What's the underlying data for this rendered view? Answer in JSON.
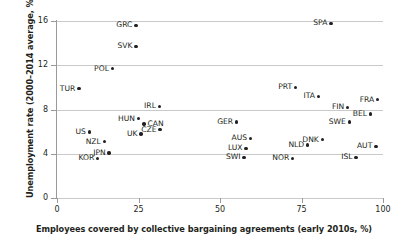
{
  "chart_data": {
    "type": "scatter",
    "title": "",
    "xlabel": "Employees covered by collective bargaining agreements (early 2010s, %)",
    "ylabel": "Unemployment rate (2000–2014 average, %)",
    "xlim": [
      0,
      100
    ],
    "ylim": [
      0,
      16
    ],
    "xticks": [
      "0",
      "25",
      "50",
      "75",
      "100"
    ],
    "yticks": [
      "0",
      "4",
      "8",
      "12",
      "16"
    ],
    "grid": "horizontal",
    "legend": "none",
    "points": [
      {
        "label": "GRC",
        "x": 24.2,
        "y": 15.6,
        "label_side": "left"
      },
      {
        "label": "SPA",
        "x": 84.0,
        "y": 15.8,
        "label_side": "left"
      },
      {
        "label": "SVK",
        "x": 24.2,
        "y": 13.7,
        "label_side": "left"
      },
      {
        "label": "POL",
        "x": 17.0,
        "y": 11.7,
        "label_side": "left"
      },
      {
        "label": "TUR",
        "x": 6.7,
        "y": 9.9,
        "label_side": "left"
      },
      {
        "label": "IRL",
        "x": 31.4,
        "y": 8.3,
        "label_side": "left"
      },
      {
        "label": "PRT",
        "x": 73.2,
        "y": 10.0,
        "label_side": "left"
      },
      {
        "label": "ITA",
        "x": 80.2,
        "y": 9.2,
        "label_side": "left"
      },
      {
        "label": "FRA",
        "x": 98.4,
        "y": 8.9,
        "label_side": "left"
      },
      {
        "label": "FIN",
        "x": 89.2,
        "y": 8.2,
        "label_side": "left"
      },
      {
        "label": "BEL",
        "x": 96.2,
        "y": 7.6,
        "label_side": "left"
      },
      {
        "label": "SWE",
        "x": 89.7,
        "y": 6.9,
        "label_side": "left"
      },
      {
        "label": "HUN",
        "x": 25.0,
        "y": 7.2,
        "label_side": "left"
      },
      {
        "label": "CAN",
        "x": 26.7,
        "y": 6.7,
        "label_side": "right"
      },
      {
        "label": "CZE",
        "x": 31.6,
        "y": 6.2,
        "label_side": "left"
      },
      {
        "label": "UK",
        "x": 25.8,
        "y": 5.8,
        "label_side": "left"
      },
      {
        "label": "US",
        "x": 9.9,
        "y": 6.0,
        "label_side": "left"
      },
      {
        "label": "GER",
        "x": 55.1,
        "y": 6.9,
        "label_side": "left"
      },
      {
        "label": "AUS",
        "x": 59.4,
        "y": 5.4,
        "label_side": "left"
      },
      {
        "label": "DNK",
        "x": 81.4,
        "y": 5.3,
        "label_side": "left"
      },
      {
        "label": "AUT",
        "x": 97.8,
        "y": 4.7,
        "label_side": "left"
      },
      {
        "label": "NLD",
        "x": 76.9,
        "y": 4.8,
        "label_side": "left"
      },
      {
        "label": "LUX",
        "x": 58.0,
        "y": 4.5,
        "label_side": "left"
      },
      {
        "label": "SWI",
        "x": 57.4,
        "y": 3.7,
        "label_side": "left"
      },
      {
        "label": "ISL",
        "x": 91.7,
        "y": 3.7,
        "label_side": "left"
      },
      {
        "label": "NOR",
        "x": 72.3,
        "y": 3.6,
        "label_side": "left"
      },
      {
        "label": "NZL",
        "x": 14.5,
        "y": 5.1,
        "label_side": "left"
      },
      {
        "label": "JPN",
        "x": 16.0,
        "y": 4.1,
        "label_side": "left"
      },
      {
        "label": "KOR",
        "x": 12.5,
        "y": 3.6,
        "label_side": "left"
      }
    ],
    "colors": {
      "marker": "#231f20",
      "grid": "#c9c9c9",
      "axis": "#9a9a9a",
      "text": "#231f20",
      "background": "#ffffff"
    }
  }
}
